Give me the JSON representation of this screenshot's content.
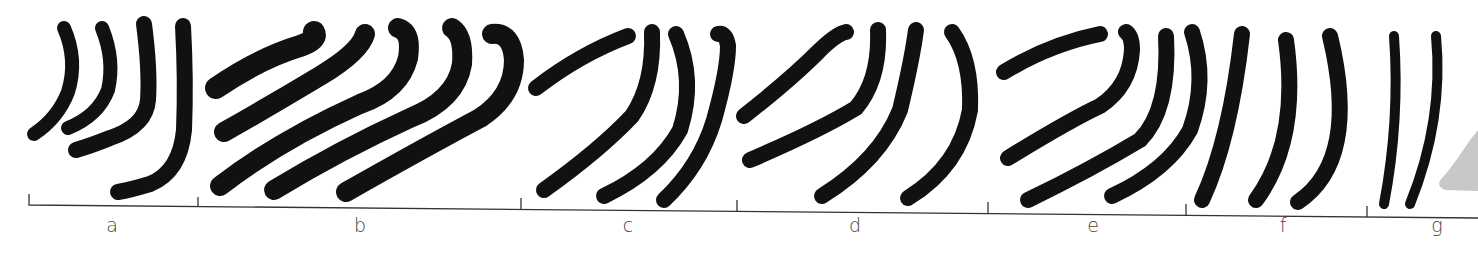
{
  "figure": {
    "groups": [
      {
        "label": "a",
        "label_x": 112,
        "start_x": 29,
        "end_x": 198,
        "stroke_count": 4
      },
      {
        "label": "b",
        "label_x": 360,
        "start_x": 198,
        "end_x": 521,
        "stroke_count": 5
      },
      {
        "label": "c",
        "label_x": 628,
        "start_x": 521,
        "end_x": 737,
        "stroke_count": 4
      },
      {
        "label": "d",
        "label_x": 855,
        "start_x": 737,
        "end_x": 988,
        "stroke_count": 4
      },
      {
        "label": "e",
        "label_x": 1093,
        "start_x": 988,
        "end_x": 1186,
        "stroke_count": 4
      },
      {
        "label": "f",
        "label_x": 1283,
        "start_x": 1186,
        "end_x": 1367,
        "stroke_count": 3
      },
      {
        "label": "g",
        "label_x": 1437,
        "start_x": 1367,
        "end_x": 1478,
        "stroke_count": 2
      }
    ],
    "colors": {
      "stroke": "#111111",
      "axis": "#333333",
      "label": "#444444",
      "shadow": "#c8c8c8"
    }
  }
}
